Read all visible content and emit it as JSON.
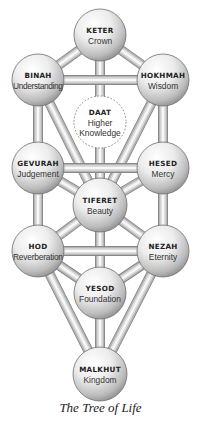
{
  "caption": "The Tree of Life",
  "colors": {
    "pipe_light": "#f4f4f4",
    "pipe_dark": "#9a9a9a",
    "sphere_light": "#ffffff",
    "sphere_dark": "#8c8c8c",
    "outline": "#6e6e6e",
    "text": "#222222",
    "background": "#ffffff"
  },
  "nodes": [
    {
      "id": "keter",
      "title": "KETER",
      "subtitle": "Crown",
      "cx": 100,
      "cy": 35,
      "r": 26
    },
    {
      "id": "binah",
      "title": "BINAH",
      "subtitle": "Understanding",
      "cx": 38,
      "cy": 80,
      "r": 26
    },
    {
      "id": "hokhmah",
      "title": "HOKHMAH",
      "subtitle": "Wisdom",
      "cx": 163,
      "cy": 80,
      "r": 26
    },
    {
      "id": "daat",
      "title": "DAAT",
      "subtitle": "Higher",
      "subtitle2": "Knowledge",
      "cx": 100,
      "cy": 122,
      "r": 26,
      "dashed": true
    },
    {
      "id": "gevurah",
      "title": "GEVURAH",
      "subtitle": "Judgement",
      "cx": 38,
      "cy": 168,
      "r": 26
    },
    {
      "id": "hesed",
      "title": "HESED",
      "subtitle": "Mercy",
      "cx": 163,
      "cy": 168,
      "r": 26
    },
    {
      "id": "tiferet",
      "title": "TIFERET",
      "subtitle": "Beauty",
      "cx": 100,
      "cy": 205,
      "r": 27
    },
    {
      "id": "hod",
      "title": "HOD",
      "subtitle": "Reverberation",
      "cx": 38,
      "cy": 251,
      "r": 26
    },
    {
      "id": "nezah",
      "title": "NEZAH",
      "subtitle": "Eternity",
      "cx": 163,
      "cy": 251,
      "r": 26
    },
    {
      "id": "yesod",
      "title": "YESOD",
      "subtitle": "Foundation",
      "cx": 100,
      "cy": 293,
      "r": 26
    },
    {
      "id": "malkhut",
      "title": "MALKHUT",
      "subtitle": "Kingdom",
      "cx": 100,
      "cy": 374,
      "r": 27
    }
  ],
  "paths": [
    [
      "keter",
      "binah"
    ],
    [
      "keter",
      "hokhmah"
    ],
    [
      "keter",
      "tiferet"
    ],
    [
      "binah",
      "hokhmah"
    ],
    [
      "binah",
      "gevurah"
    ],
    [
      "binah",
      "tiferet"
    ],
    [
      "hokhmah",
      "hesed"
    ],
    [
      "hokhmah",
      "tiferet"
    ],
    [
      "gevurah",
      "hesed"
    ],
    [
      "gevurah",
      "tiferet"
    ],
    [
      "gevurah",
      "hod"
    ],
    [
      "hesed",
      "tiferet"
    ],
    [
      "hesed",
      "nezah"
    ],
    [
      "tiferet",
      "hod"
    ],
    [
      "tiferet",
      "nezah"
    ],
    [
      "tiferet",
      "yesod"
    ],
    [
      "hod",
      "nezah"
    ],
    [
      "hod",
      "yesod"
    ],
    [
      "hod",
      "malkhut"
    ],
    [
      "nezah",
      "yesod"
    ],
    [
      "nezah",
      "malkhut"
    ],
    [
      "yesod",
      "malkhut"
    ]
  ]
}
